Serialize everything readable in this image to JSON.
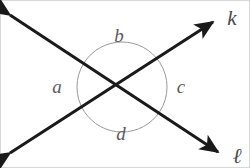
{
  "figure": {
    "type": "geometry-diagram",
    "width": 250,
    "height": 168,
    "background_color": "#ffffff",
    "border_color": "#d8d8d8",
    "line_color": "#1a1a1a",
    "line_width": 3,
    "arc_color": "#9a9a9a",
    "arc_width": 1,
    "arc_radius": 45,
    "label_color": "#5a5a5e",
    "line_label_color": "#4a4a4e",
    "intersection": {
      "x": 122,
      "y": 87
    }
  },
  "lines": [
    {
      "name": "k",
      "label": "k",
      "label_x": 232,
      "label_y": 18,
      "x1": 10,
      "y1": 153,
      "x2": 213,
      "y2": 22,
      "arrow_start": true,
      "arrow_end": true
    },
    {
      "name": "l",
      "label": "ℓ",
      "label_x": 237,
      "label_y": 156,
      "x1": 10,
      "y1": 15,
      "x2": 218,
      "y2": 152,
      "arrow_start": true,
      "arrow_end": true
    }
  ],
  "angles": [
    {
      "id": "a",
      "label": "a",
      "position": "left",
      "x": 57,
      "y": 86,
      "arc_start_deg": 147,
      "arc_end_deg": 213
    },
    {
      "id": "b",
      "label": "b",
      "position": "top",
      "x": 119,
      "y": 35,
      "arc_start_deg": 213,
      "arc_end_deg": 327
    },
    {
      "id": "c",
      "label": "c",
      "position": "right",
      "x": 181,
      "y": 86,
      "arc_start_deg": 327,
      "arc_end_deg": 33
    },
    {
      "id": "d",
      "label": "d",
      "position": "bottom",
      "x": 121,
      "y": 133,
      "arc_start_deg": 33,
      "arc_end_deg": 147
    }
  ]
}
